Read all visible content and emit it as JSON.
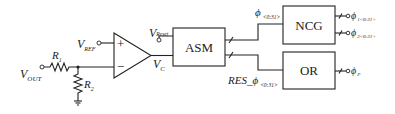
{
  "diagram": {
    "type": "circuit-block-diagram",
    "inputs": {
      "vout": {
        "main": "V",
        "sub": "OUT"
      },
      "vref": {
        "main": "V",
        "sub": "REF"
      },
      "vreset": {
        "main": "V",
        "sub": "Reset"
      }
    },
    "resistors": [
      {
        "main": "R",
        "sub": "1"
      },
      {
        "main": "R",
        "sub": "2"
      }
    ],
    "comparator": {
      "plus": "+",
      "minus": "−",
      "output": {
        "main": "V",
        "sub": "C"
      }
    },
    "blocks": {
      "asm": "ASM",
      "ncg": "NCG",
      "or": "OR"
    },
    "signals": {
      "phi_bus": {
        "main": "ϕ",
        "sub": "<0:31>"
      },
      "res_phi_bus": {
        "prefix": "RES_",
        "main": "ϕ",
        "sub": "<0:31>"
      }
    },
    "outputs": [
      {
        "main": "ϕ",
        "sub": "1<0:31>"
      },
      {
        "main": "ϕ",
        "sub": "2<0:31>"
      },
      {
        "main": "ϕ",
        "sub": "P"
      }
    ],
    "colors": {
      "line": "#222222",
      "background": "#ffffff"
    }
  }
}
